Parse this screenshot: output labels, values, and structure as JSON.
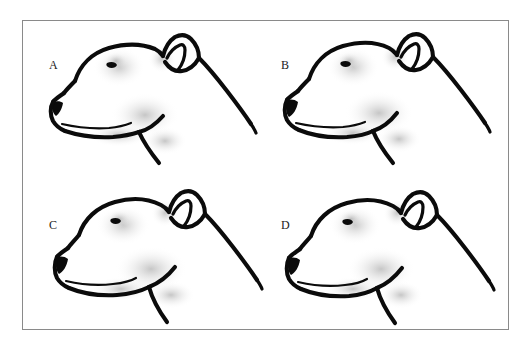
{
  "figure": {
    "background_color": "#ffffff",
    "frame_color": "#8a8a8a",
    "ink_color": "#0b0b0b",
    "layout": "2x2 grid",
    "panels": [
      {
        "id": "A",
        "label": "A",
        "subject": "dog-head-profile",
        "breed_type": "Staffordshire Bull Terrier head, left-facing profile line drawing",
        "ear": "rose ear, folded back",
        "features": [
          "nose",
          "eye",
          "mouth line",
          "jaw",
          "neck line",
          "ear"
        ]
      },
      {
        "id": "B",
        "label": "B",
        "subject": "dog-head-profile",
        "breed_type": "Staffordshire Bull Terrier head, left-facing profile line drawing",
        "ear": "rose ear, folded back",
        "features": [
          "nose",
          "eye",
          "mouth line",
          "jaw",
          "neck line",
          "ear"
        ]
      },
      {
        "id": "C",
        "label": "C",
        "subject": "dog-head-profile",
        "breed_type": "Staffordshire Bull Terrier head, left-facing profile line drawing",
        "ear": "rose ear, folded back",
        "features": [
          "nose",
          "eye",
          "mouth line",
          "jaw",
          "neck line",
          "ear"
        ]
      },
      {
        "id": "D",
        "label": "D",
        "subject": "dog-head-profile",
        "breed_type": "Staffordshire Bull Terrier head, left-facing profile line drawing",
        "ear": "rose ear, folded back",
        "features": [
          "nose",
          "eye",
          "mouth line",
          "jaw",
          "neck line",
          "ear"
        ]
      }
    ]
  }
}
